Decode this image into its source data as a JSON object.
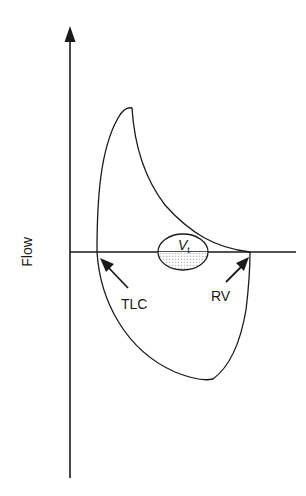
{
  "diagram": {
    "y_axis_label": "Flow",
    "labels": {
      "tlc": "TLC",
      "rv": "RV",
      "tidal_main": "V",
      "tidal_sub": "t"
    },
    "colors": {
      "stroke": "#1a1a1a",
      "shading": "#d9d9d9",
      "background": "#ffffff"
    }
  }
}
